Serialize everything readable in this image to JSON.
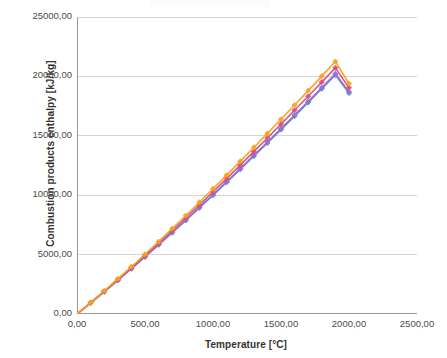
{
  "chart_data": {
    "type": "line",
    "title": "",
    "xlabel": "Temperature [°C]",
    "ylabel": "Combustion products enthalpy [kJ/kg]",
    "xlim": [
      0,
      2500
    ],
    "ylim": [
      0,
      25000
    ],
    "grid": true,
    "legend": "none",
    "x_ticks": [
      "0,00",
      "500,00",
      "1000,00",
      "1500,00",
      "2000,00",
      "2500,00"
    ],
    "x_tick_values": [
      0,
      500,
      1000,
      1500,
      2000,
      2500
    ],
    "y_ticks": [
      "0,00",
      "5000,00",
      "10000,00",
      "15000,00",
      "20000,00",
      "25000,00"
    ],
    "y_tick_values": [
      0,
      5000,
      10000,
      15000,
      20000,
      25000
    ],
    "marker": "diamond",
    "x": [
      0,
      100,
      200,
      300,
      400,
      500,
      600,
      700,
      800,
      900,
      1000,
      1100,
      1200,
      1300,
      1400,
      1500,
      1600,
      1700,
      1800,
      1900,
      2000
    ],
    "series": [
      {
        "name": "Series 1",
        "color": "#F6A21E",
        "values": [
          0,
          960,
          1940,
          2950,
          3980,
          5030,
          6100,
          7190,
          8290,
          9410,
          10540,
          11690,
          12850,
          14020,
          15200,
          16390,
          17590,
          18800,
          20020,
          21250,
          19400
        ]
      },
      {
        "name": "Series 2",
        "color": "#E2497E",
        "values": [
          0,
          950,
          1915,
          2900,
          3905,
          4930,
          5970,
          7030,
          8100,
          9190,
          10290,
          11400,
          12530,
          13670,
          14820,
          15980,
          17150,
          18330,
          19520,
          20720,
          19050
        ]
      },
      {
        "name": "Series 3",
        "color": "#8878D8",
        "values": [
          0,
          930,
          1880,
          2845,
          3830,
          4830,
          5850,
          6880,
          7930,
          8990,
          10060,
          11150,
          12250,
          13360,
          14480,
          15610,
          16750,
          17900,
          19060,
          20230,
          18700
        ]
      },
      {
        "name": "Series 4",
        "color": "#6B78C8",
        "values": [
          0,
          925,
          1870,
          2830,
          3810,
          4805,
          5820,
          6845,
          7885,
          8940,
          10005,
          11085,
          12180,
          13285,
          14400,
          15525,
          16660,
          17805,
          18960,
          20125,
          18600
        ]
      }
    ],
    "endpoints": {
      "x_max_plotted": 2000,
      "note": "series terminate near 2000 °C"
    }
  },
  "axes": {
    "y_title": "Combustion products enthalpy [kJ/kg]",
    "x_title": "Temperature [°C]"
  }
}
